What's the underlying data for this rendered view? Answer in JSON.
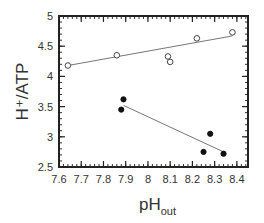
{
  "chart_data": {
    "type": "scatter",
    "title": "",
    "xlabel": "pH",
    "xlabel_sub": "out",
    "ylabel": "H⁺/ATP",
    "xlim": [
      7.6,
      8.45
    ],
    "ylim": [
      2.5,
      5
    ],
    "xticks": [
      7.6,
      7.7,
      7.8,
      7.9,
      8,
      8.1,
      8.2,
      8.3,
      8.4
    ],
    "xtick_labels": [
      "7.6",
      "7.7",
      "7.8",
      "7.9",
      "8",
      "8.1",
      "8.2",
      "8.3",
      "8.4"
    ],
    "yticks": [
      2.5,
      3,
      3.5,
      4,
      4.5,
      5
    ],
    "ytick_labels": [
      "2.5",
      "3",
      "3.5",
      "4",
      "4.5",
      "5"
    ],
    "grid": false,
    "legend": null,
    "series": [
      {
        "name": "open circles",
        "marker": "open-circle",
        "x": [
          7.64,
          7.86,
          8.09,
          8.1,
          8.22,
          8.38
        ],
        "y": [
          4.18,
          4.35,
          4.33,
          4.24,
          4.63,
          4.73
        ],
        "fit_line": {
          "x": [
            7.64,
            8.38
          ],
          "y": [
            4.18,
            4.67
          ]
        }
      },
      {
        "name": "filled circles",
        "marker": "filled-circle",
        "x": [
          7.89,
          7.88,
          8.28,
          8.25,
          8.34
        ],
        "y": [
          3.62,
          3.45,
          3.05,
          2.75,
          2.72
        ],
        "fit_line": {
          "x": [
            7.89,
            8.34
          ],
          "y": [
            3.52,
            2.75
          ]
        }
      }
    ]
  },
  "axes_px": {
    "left": 59,
    "right": 248,
    "top": 16,
    "bottom": 167
  }
}
